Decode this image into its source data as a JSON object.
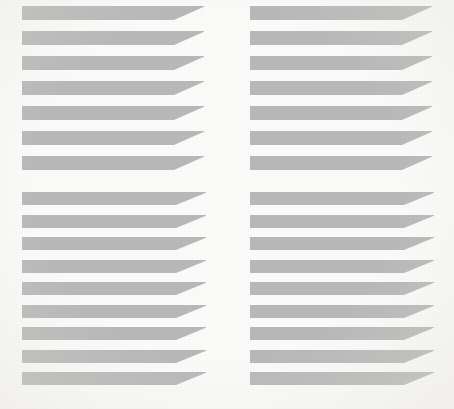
{
  "figure": {
    "width": 454,
    "height": 409,
    "background_color": "#fbfbfa",
    "stripe_color": "#b9b9b9"
  },
  "panels": [
    {
      "id": "top-left",
      "name": "panel-top-left",
      "x": 22,
      "y": 6,
      "width": 182,
      "stripe_count": 7,
      "stripe_height": 14,
      "stripe_pitch": 25,
      "wedge_width": 30,
      "taper_direction": "right"
    },
    {
      "id": "top-right",
      "name": "panel-top-right",
      "x": 250,
      "y": 6,
      "width": 182,
      "stripe_count": 7,
      "stripe_height": 14,
      "stripe_pitch": 25,
      "wedge_width": 30,
      "taper_direction": "right"
    },
    {
      "id": "bottom-left",
      "name": "panel-bottom-left",
      "x": 22,
      "y": 192,
      "width": 184,
      "stripe_count": 9,
      "stripe_height": 13,
      "stripe_pitch": 22.5,
      "wedge_width": 30,
      "taper_direction": "right"
    },
    {
      "id": "bottom-right",
      "name": "panel-bottom-right",
      "x": 250,
      "y": 192,
      "width": 184,
      "stripe_count": 9,
      "stripe_height": 13,
      "stripe_pitch": 22.5,
      "wedge_width": 30,
      "taper_direction": "right"
    }
  ],
  "chart_data": {
    "type": "table",
    "xlabel": "",
    "ylabel": "",
    "categories": [
      "top-left",
      "top-right",
      "bottom-left",
      "bottom-right"
    ],
    "series": [
      {
        "name": "stripe count",
        "values": [
          7,
          7,
          9,
          9
        ]
      },
      {
        "name": "stripe height (px)",
        "values": [
          14,
          14,
          13,
          13
        ]
      },
      {
        "name": "stripe pitch (px)",
        "values": [
          25,
          25,
          22.5,
          22.5
        ]
      }
    ]
  }
}
